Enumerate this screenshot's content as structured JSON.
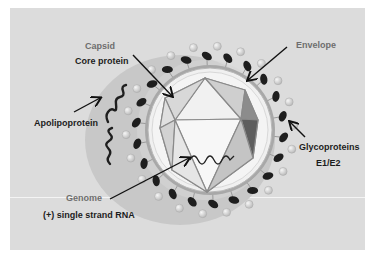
{
  "diagram": {
    "labels": {
      "capsid": "Capsid",
      "core_protein": "Core protein",
      "envelope": "Envelope",
      "apolipoprotein": "Apolipoprotein",
      "glycoproteins": "Glycoproteins",
      "glycoproteins_sub": "E1/E2",
      "genome": "Genome",
      "genome_sub": "(+) single strand RNA"
    },
    "colors": {
      "background": "#dcdcdc",
      "halo": "#c4c4c4",
      "envelope_ring": "#9a9a9a",
      "inner_membrane": "#f2f2f2",
      "capsid_face_light": "#e8e8e8",
      "capsid_face_dark": "#6a6a6a",
      "glycoprotein_dark": "#1e1e1e",
      "glycoprotein_light": "#cfcfcf",
      "label_gray": "#6e6e6e",
      "label_dark": "#1c1c1c"
    }
  }
}
